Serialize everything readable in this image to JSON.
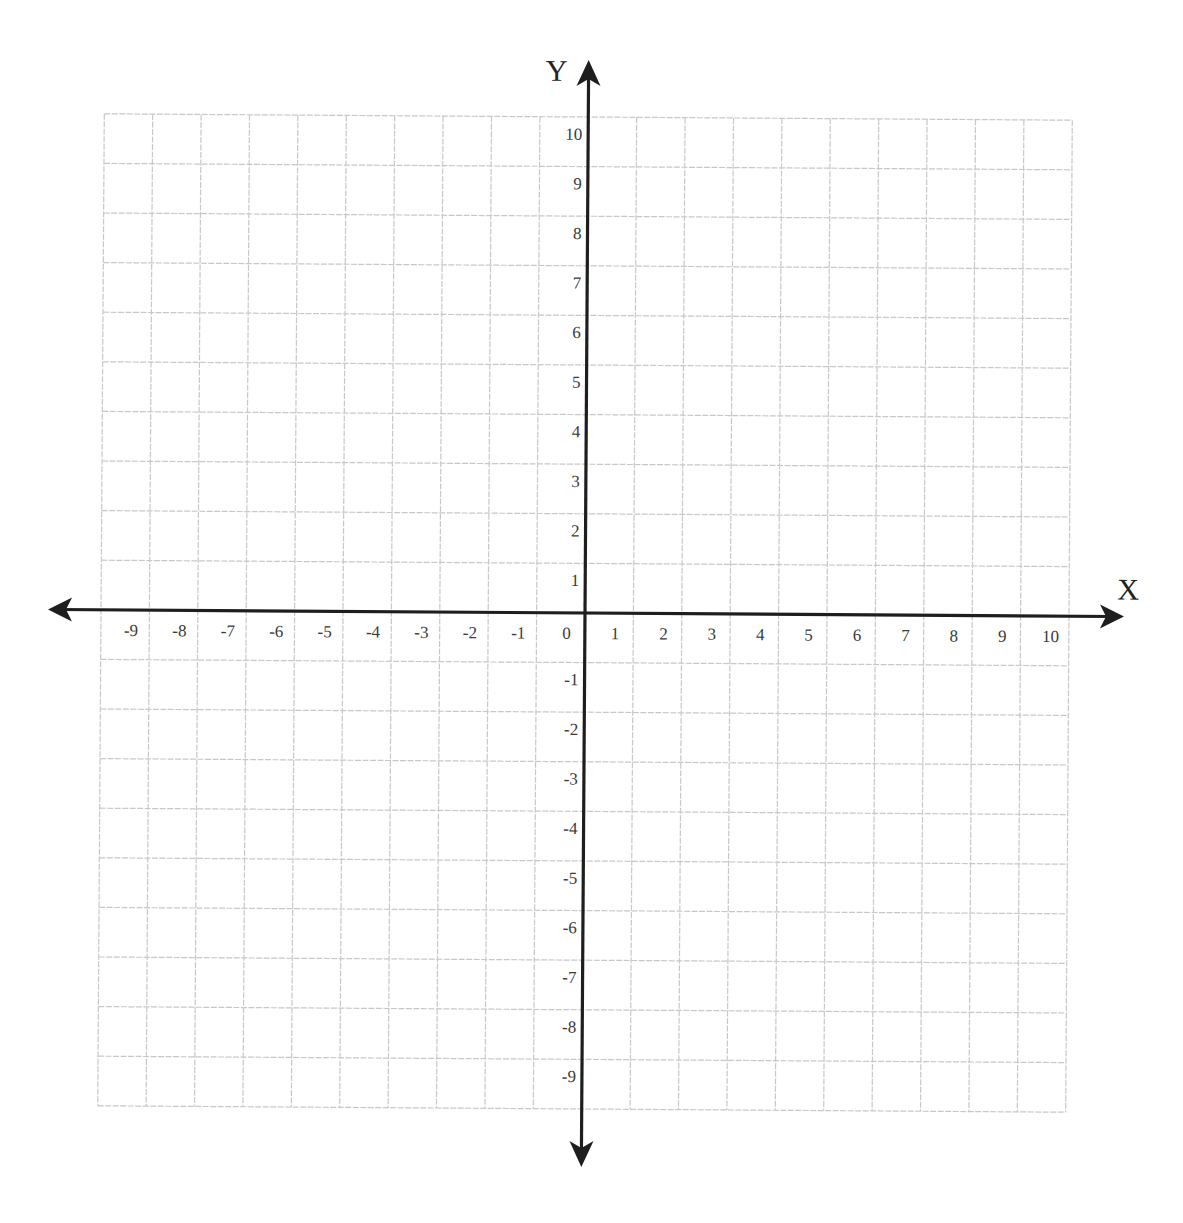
{
  "chart_data": {
    "type": "coordinate-grid",
    "title": "",
    "xlabel": "X",
    "ylabel": "Y",
    "xlim": [
      -10,
      10
    ],
    "ylim": [
      -10,
      10
    ],
    "grid": true,
    "grid_step": 1,
    "x_tick_labels": [
      "-9",
      "-8",
      "-7",
      "-6",
      "-5",
      "-4",
      "-3",
      "-2",
      "-1",
      "0",
      "1",
      "2",
      "3",
      "4",
      "5",
      "6",
      "7",
      "8",
      "9",
      "10"
    ],
    "y_tick_labels": [
      "10",
      "9",
      "8",
      "7",
      "6",
      "5",
      "4",
      "3",
      "2",
      "1",
      "-1",
      "-2",
      "-3",
      "-4",
      "-5",
      "-6",
      "-7",
      "-8",
      "-9"
    ],
    "series": [],
    "legend": null
  },
  "colors": {
    "background": "#ffffff",
    "grid": "#c8c8c8",
    "axis": "#1e1e1e",
    "label": "#3a3a3a"
  }
}
